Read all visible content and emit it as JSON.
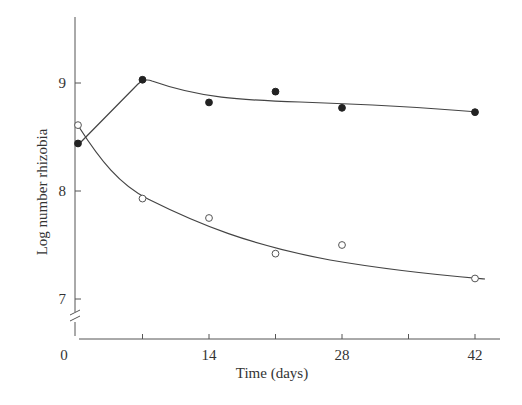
{
  "chart_data": {
    "type": "line",
    "title": "",
    "xlabel": "Time (days)",
    "ylabel": "Log number rhizobia",
    "xlim": [
      0,
      44
    ],
    "ylim": [
      6.7,
      9.6
    ],
    "x_ticks": [
      0,
      7,
      14,
      21,
      28,
      35,
      42
    ],
    "x_tick_labels": [
      "0",
      "",
      "14",
      "",
      "28",
      "",
      "42"
    ],
    "y_ticks": [
      7,
      8,
      9
    ],
    "y_tick_labels": [
      "7",
      "8",
      "9"
    ],
    "axis_break": "y-axis break below 7",
    "grid": false,
    "legend": "none",
    "series": [
      {
        "name": "filled circles",
        "marker": "filled-circle",
        "x": [
          0,
          7,
          14,
          21,
          28,
          42
        ],
        "y": [
          8.44,
          9.03,
          8.82,
          8.92,
          8.77,
          8.73
        ]
      },
      {
        "name": "open circles",
        "marker": "open-circle",
        "x": [
          0,
          7,
          14,
          21,
          28,
          42
        ],
        "y": [
          8.61,
          7.93,
          7.75,
          7.42,
          7.5,
          7.19
        ]
      }
    ]
  }
}
